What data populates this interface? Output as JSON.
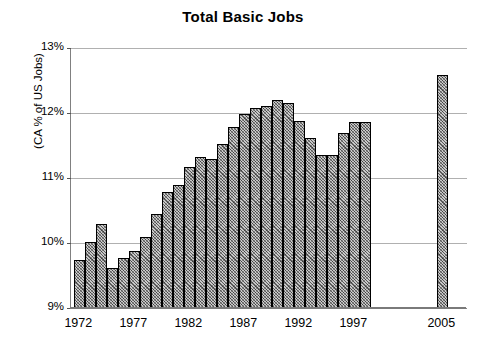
{
  "chart_data": {
    "type": "bar",
    "title": "Total Basic Jobs",
    "xlabel": "",
    "ylabel": "(CA % of US Jobs)",
    "ylim": [
      9,
      13
    ],
    "ytick_labels": [
      "9%",
      "10%",
      "11%",
      "12%",
      "13%"
    ],
    "ytick_values": [
      9,
      10,
      11,
      12,
      13
    ],
    "xtick_labels": [
      "1972",
      "1977",
      "1982",
      "1987",
      "1992",
      "1997",
      "2005"
    ],
    "xtick_values": [
      1972,
      1977,
      1982,
      1987,
      1992,
      1997,
      2005
    ],
    "grid": true,
    "legend": "none",
    "bar_fill": "#c8c8c8",
    "bar_edge": "#000000",
    "gridline_color": "#b0b0b0",
    "categories": [
      "1972",
      "1973",
      "1974",
      "1975",
      "1976",
      "1977",
      "1978",
      "1979",
      "1980",
      "1981",
      "1982",
      "1983",
      "1984",
      "1985",
      "1986",
      "1987",
      "1988",
      "1989",
      "1990",
      "1991",
      "1992",
      "1993",
      "1994",
      "1995",
      "1996",
      "1997",
      "1998",
      "2005"
    ],
    "values": [
      9.74,
      10.02,
      10.3,
      9.62,
      9.77,
      9.88,
      10.1,
      10.45,
      10.78,
      10.89,
      11.17,
      11.32,
      11.3,
      11.52,
      11.79,
      11.98,
      12.07,
      12.11,
      12.2,
      12.15,
      11.87,
      11.61,
      11.35,
      11.35,
      11.69,
      11.86,
      11.86,
      12.59
    ]
  }
}
